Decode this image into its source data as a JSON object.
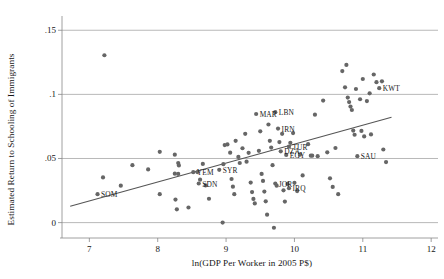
{
  "chart_data": {
    "type": "scatter",
    "title": "",
    "xlabel": "ln(GDP Per Worker in 2005 P$)",
    "ylabel": "Estimated Return to Schooling of Immigrants",
    "xlim": [
      6.6,
      12.1
    ],
    "ylim": [
      -0.012,
      0.158
    ],
    "xticks": [
      "7",
      "8",
      "9",
      "10",
      "11",
      "12"
    ],
    "xtick_values": [
      7,
      8,
      9,
      10,
      11,
      12
    ],
    "yticks": [
      ".15",
      ".1",
      ".05",
      "0"
    ],
    "ytick_values": [
      0.15,
      0.1,
      0.05,
      0
    ],
    "grid": "horizontal gridlines at y = 0, .05, .1, .15",
    "legend": "none",
    "marker_color": "#666666",
    "line_color": "#555555",
    "axis_color": "#888888",
    "fit_line": {
      "label": "linear fit",
      "x0": 6.72,
      "y0": 0.0128,
      "x1": 11.42,
      "y1": 0.0822
    },
    "labeled_points": [
      {
        "code": "SOM",
        "x": 7.12,
        "y": 0.0222,
        "anchor": "right"
      },
      {
        "code": "YEM",
        "x": 8.52,
        "y": 0.0393,
        "anchor": "right"
      },
      {
        "code": "SDN",
        "x": 8.6,
        "y": 0.0305,
        "anchor": "right"
      },
      {
        "code": "SYR",
        "x": 8.9,
        "y": 0.0412,
        "anchor": "right"
      },
      {
        "code": "MAR",
        "x": 9.44,
        "y": 0.0847,
        "anchor": "right"
      },
      {
        "code": "LBN",
        "x": 9.72,
        "y": 0.0861,
        "anchor": "right"
      },
      {
        "code": "IRN",
        "x": 9.76,
        "y": 0.0733,
        "anchor": "right"
      },
      {
        "code": "TUR",
        "x": 9.92,
        "y": 0.0592,
        "anchor": "right"
      },
      {
        "code": "DZA",
        "x": 9.8,
        "y": 0.0556,
        "anchor": "right"
      },
      {
        "code": "EGY",
        "x": 9.88,
        "y": 0.0528,
        "anchor": "right"
      },
      {
        "code": "JOR",
        "x": 9.72,
        "y": 0.0305,
        "anchor": "right"
      },
      {
        "code": "IRQ",
        "x": 9.92,
        "y": 0.0268,
        "anchor": "right"
      },
      {
        "code": "SAU",
        "x": 10.92,
        "y": 0.0518,
        "anchor": "right"
      },
      {
        "code": "KWT",
        "x": 11.24,
        "y": 0.1048,
        "anchor": "right"
      }
    ],
    "points": [
      {
        "x": 7.22,
        "y": 0.1305
      },
      {
        "x": 7.12,
        "y": 0.0222
      },
      {
        "x": 7.2,
        "y": 0.0352
      },
      {
        "x": 7.46,
        "y": 0.0288
      },
      {
        "x": 7.63,
        "y": 0.0448
      },
      {
        "x": 7.86,
        "y": 0.0415
      },
      {
        "x": 8.03,
        "y": 0.0552
      },
      {
        "x": 8.03,
        "y": 0.0222
      },
      {
        "x": 8.25,
        "y": 0.053
      },
      {
        "x": 8.3,
        "y": 0.0464
      },
      {
        "x": 8.31,
        "y": 0.0446
      },
      {
        "x": 8.25,
        "y": 0.0382
      },
      {
        "x": 8.3,
        "y": 0.038
      },
      {
        "x": 8.26,
        "y": 0.018
      },
      {
        "x": 8.28,
        "y": 0.0104
      },
      {
        "x": 8.45,
        "y": 0.0118
      },
      {
        "x": 8.52,
        "y": 0.0393
      },
      {
        "x": 8.58,
        "y": 0.0394
      },
      {
        "x": 8.6,
        "y": 0.0305
      },
      {
        "x": 8.62,
        "y": 0.0335
      },
      {
        "x": 8.66,
        "y": 0.0458
      },
      {
        "x": 8.7,
        "y": 0.029
      },
      {
        "x": 8.75,
        "y": 0.0186
      },
      {
        "x": 8.9,
        "y": 0.0412
      },
      {
        "x": 8.96,
        "y": 0.0456
      },
      {
        "x": 8.98,
        "y": 0.0605
      },
      {
        "x": 8.95,
        "y": 0.0
      },
      {
        "x": 9.02,
        "y": 0.061
      },
      {
        "x": 9.06,
        "y": 0.0545
      },
      {
        "x": 9.08,
        "y": 0.034
      },
      {
        "x": 9.1,
        "y": 0.028
      },
      {
        "x": 9.12,
        "y": 0.0222
      },
      {
        "x": 9.14,
        "y": 0.0638
      },
      {
        "x": 9.18,
        "y": 0.0512
      },
      {
        "x": 9.2,
        "y": 0.0465
      },
      {
        "x": 9.24,
        "y": 0.058
      },
      {
        "x": 9.28,
        "y": 0.0692
      },
      {
        "x": 9.3,
        "y": 0.0475
      },
      {
        "x": 9.33,
        "y": 0.0544
      },
      {
        "x": 9.36,
        "y": 0.0312
      },
      {
        "x": 9.38,
        "y": 0.0238
      },
      {
        "x": 9.4,
        "y": 0.0185
      },
      {
        "x": 9.42,
        "y": 0.015
      },
      {
        "x": 9.44,
        "y": 0.0847
      },
      {
        "x": 9.48,
        "y": 0.056
      },
      {
        "x": 9.5,
        "y": 0.0712
      },
      {
        "x": 9.52,
        "y": 0.038
      },
      {
        "x": 9.54,
        "y": 0.0325
      },
      {
        "x": 9.56,
        "y": 0.0242
      },
      {
        "x": 9.58,
        "y": 0.0166
      },
      {
        "x": 9.6,
        "y": 0.0062
      },
      {
        "x": 9.62,
        "y": 0.0765
      },
      {
        "x": 9.64,
        "y": 0.0638
      },
      {
        "x": 9.66,
        "y": 0.0585
      },
      {
        "x": 9.68,
        "y": 0.0448
      },
      {
        "x": 9.72,
        "y": 0.0861
      },
      {
        "x": 9.72,
        "y": 0.0305
      },
      {
        "x": 9.74,
        "y": 0.0288
      },
      {
        "x": 9.76,
        "y": 0.0733
      },
      {
        "x": 9.78,
        "y": 0.0628
      },
      {
        "x": 9.8,
        "y": 0.0556
      },
      {
        "x": 9.82,
        "y": 0.0692
      },
      {
        "x": 9.84,
        "y": 0.0252
      },
      {
        "x": 9.86,
        "y": 0.0164
      },
      {
        "x": 9.88,
        "y": 0.0528
      },
      {
        "x": 9.9,
        "y": 0.0302
      },
      {
        "x": 9.92,
        "y": 0.0592
      },
      {
        "x": 9.92,
        "y": 0.0268
      },
      {
        "x": 9.7,
        "y": -0.004
      },
      {
        "x": 9.94,
        "y": 0.0622
      },
      {
        "x": 9.98,
        "y": 0.0698
      },
      {
        "x": 10.0,
        "y": 0.031
      },
      {
        "x": 10.04,
        "y": 0.0246
      },
      {
        "x": 10.08,
        "y": 0.053
      },
      {
        "x": 10.12,
        "y": 0.0368
      },
      {
        "x": 10.2,
        "y": 0.0612
      },
      {
        "x": 10.24,
        "y": 0.0522
      },
      {
        "x": 10.26,
        "y": 0.0522
      },
      {
        "x": 10.3,
        "y": 0.0842
      },
      {
        "x": 10.34,
        "y": 0.0518
      },
      {
        "x": 10.42,
        "y": 0.0952
      },
      {
        "x": 10.48,
        "y": 0.0548
      },
      {
        "x": 10.52,
        "y": 0.0345
      },
      {
        "x": 10.56,
        "y": 0.0278
      },
      {
        "x": 10.6,
        "y": 0.0582
      },
      {
        "x": 10.64,
        "y": 0.0222
      },
      {
        "x": 10.7,
        "y": 0.1182
      },
      {
        "x": 10.74,
        "y": 0.1055
      },
      {
        "x": 10.76,
        "y": 0.123
      },
      {
        "x": 10.78,
        "y": 0.0975
      },
      {
        "x": 10.8,
        "y": 0.094
      },
      {
        "x": 10.82,
        "y": 0.0905
      },
      {
        "x": 10.84,
        "y": 0.0878
      },
      {
        "x": 10.86,
        "y": 0.0718
      },
      {
        "x": 10.88,
        "y": 0.0685
      },
      {
        "x": 10.9,
        "y": 0.1042
      },
      {
        "x": 10.92,
        "y": 0.0518
      },
      {
        "x": 10.96,
        "y": 0.0962
      },
      {
        "x": 10.98,
        "y": 0.0715
      },
      {
        "x": 11.0,
        "y": 0.112
      },
      {
        "x": 11.02,
        "y": 0.0672
      },
      {
        "x": 11.06,
        "y": 0.0948
      },
      {
        "x": 11.1,
        "y": 0.1008
      },
      {
        "x": 11.12,
        "y": 0.0688
      },
      {
        "x": 11.16,
        "y": 0.1155
      },
      {
        "x": 11.2,
        "y": 0.1095
      },
      {
        "x": 11.24,
        "y": 0.1048
      },
      {
        "x": 11.28,
        "y": 0.1102
      },
      {
        "x": 11.3,
        "y": 0.057
      },
      {
        "x": 11.34,
        "y": 0.0472
      }
    ]
  }
}
